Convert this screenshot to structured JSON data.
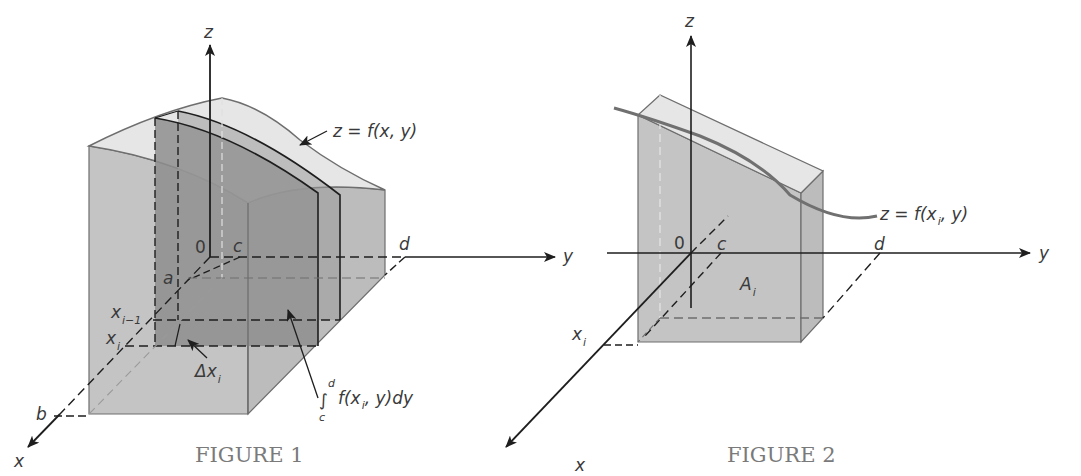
{
  "figure1": {
    "caption": "FIGURE 1",
    "axes": {
      "z": "z",
      "y": "y",
      "x": "x"
    },
    "origin": "0",
    "labels": {
      "a": "a",
      "b": "b",
      "c": "c",
      "d": "d",
      "x_prev": "x",
      "x_prev_sub": "i−1",
      "x_i": "x",
      "x_i_sub": "i",
      "delta": "Δx",
      "delta_sub": "i",
      "surface": "z = f(x, y)",
      "integral_sign": "∫",
      "integral_upper": "d",
      "integral_lower": "c",
      "integral_body_pre": "f(x",
      "integral_body_sub": "i",
      "integral_body_post": ", y)dy"
    }
  },
  "figure2": {
    "caption": "FIGURE 2",
    "axes": {
      "z": "z",
      "y": "y",
      "x": "x"
    },
    "origin": "0",
    "labels": {
      "c": "c",
      "d": "d",
      "x_i": "x",
      "x_i_sub": "i",
      "area": "A",
      "area_sub": "i",
      "curve_pre": "z = f(x",
      "curve_sub": "i",
      "curve_post": ", y)"
    }
  },
  "colors": {
    "solid_fill": "#c4c4c4",
    "top_fill": "#e6e6e6",
    "slab_fill": "#8e8e8e",
    "edge": "#6e6e6e",
    "axis": "#1e1e1e",
    "curve": "#707070",
    "caption": "#7a7a7a"
  }
}
